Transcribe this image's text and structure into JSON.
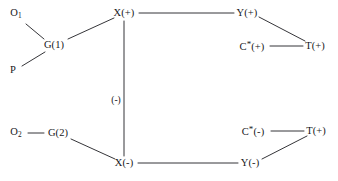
{
  "diagram": {
    "background_color": "#ffffff",
    "edge_color": "#1e1e22",
    "text_color": "#17171a",
    "nodes": [
      {
        "id": "O1",
        "base": "O",
        "sub": "1",
        "star": false,
        "suffix": "",
        "x": 16,
        "y": 14
      },
      {
        "id": "P",
        "base": "P",
        "sub": "",
        "star": false,
        "suffix": "",
        "x": 13,
        "y": 70
      },
      {
        "id": "G1",
        "base": "G(1)",
        "sub": "",
        "star": false,
        "suffix": "",
        "x": 54,
        "y": 45
      },
      {
        "id": "O2",
        "base": "O",
        "sub": "2",
        "star": false,
        "suffix": "",
        "x": 16,
        "y": 133
      },
      {
        "id": "G2",
        "base": "G(2)",
        "sub": "",
        "star": false,
        "suffix": "",
        "x": 58,
        "y": 133
      },
      {
        "id": "Xplus",
        "base": "X",
        "sub": "",
        "star": false,
        "suffix": "(+)",
        "x": 124,
        "y": 13
      },
      {
        "id": "Xminus",
        "base": "X",
        "sub": "",
        "star": false,
        "suffix": "(-)",
        "x": 124,
        "y": 163
      },
      {
        "id": "Yplus",
        "base": "Y",
        "sub": "",
        "star": false,
        "suffix": "(+)",
        "x": 247,
        "y": 13
      },
      {
        "id": "Yminus",
        "base": "Y",
        "sub": "",
        "star": false,
        "suffix": "(-)",
        "x": 250,
        "y": 163
      },
      {
        "id": "Cplus",
        "base": "C",
        "sub": "",
        "star": true,
        "suffix": "(+)",
        "x": 252,
        "y": 46
      },
      {
        "id": "Cminus",
        "base": "C",
        "sub": "",
        "star": true,
        "suffix": "(-)",
        "x": 253,
        "y": 131
      },
      {
        "id": "Tplus1",
        "base": "T",
        "sub": "",
        "star": false,
        "suffix": "(+)",
        "x": 315,
        "y": 46
      },
      {
        "id": "Tplus2",
        "base": "T",
        "sub": "",
        "star": false,
        "suffix": "(+)",
        "x": 316,
        "y": 131
      }
    ],
    "edges": [
      {
        "id": "O1-G1",
        "from": "O1",
        "to": "G1",
        "x1": 26,
        "y1": 24,
        "x2": 44,
        "y2": 39
      },
      {
        "id": "P-G1",
        "from": "P",
        "to": "G1",
        "x1": 22,
        "y1": 66,
        "x2": 45,
        "y2": 52
      },
      {
        "id": "G1-Xplus",
        "from": "G1",
        "to": "Xplus",
        "x1": 68,
        "y1": 39,
        "x2": 114,
        "y2": 18
      },
      {
        "id": "Xplus-Yplus",
        "from": "Xplus",
        "to": "Yplus",
        "x1": 139,
        "y1": 13,
        "x2": 234,
        "y2": 13
      },
      {
        "id": "Yplus-Tplus1",
        "from": "Yplus",
        "to": "Tplus1",
        "x1": 259,
        "y1": 17,
        "x2": 305,
        "y2": 41
      },
      {
        "id": "Cplus-Tplus1",
        "from": "Cplus",
        "to": "Tplus1",
        "x1": 270,
        "y1": 46,
        "x2": 303,
        "y2": 46
      },
      {
        "id": "Xplus-Xminus",
        "from": "Xplus",
        "to": "Xminus",
        "x1": 124,
        "y1": 21,
        "x2": 124,
        "y2": 156
      },
      {
        "id": "O2-G2",
        "from": "O2",
        "to": "G2",
        "x1": 28,
        "y1": 133,
        "x2": 44,
        "y2": 133
      },
      {
        "id": "G2-Xminus",
        "from": "G2",
        "to": "Xminus",
        "x1": 71,
        "y1": 139,
        "x2": 115,
        "y2": 159
      },
      {
        "id": "Xminus-Yminus",
        "from": "Xminus",
        "to": "Yminus",
        "x1": 138,
        "y1": 163,
        "x2": 238,
        "y2": 163
      },
      {
        "id": "Yminus-Tplus2",
        "from": "Yminus",
        "to": "Tplus2",
        "x1": 262,
        "y1": 159,
        "x2": 307,
        "y2": 136
      },
      {
        "id": "Cminus-Tplus2",
        "from": "Cminus",
        "to": "Tplus2",
        "x1": 271,
        "y1": 131,
        "x2": 304,
        "y2": 131
      }
    ],
    "edge_labels": [
      {
        "id": "vertical-sign",
        "text": "(-)",
        "for_edge": "Xplus-Xminus",
        "x": 116,
        "y": 101
      }
    ]
  }
}
